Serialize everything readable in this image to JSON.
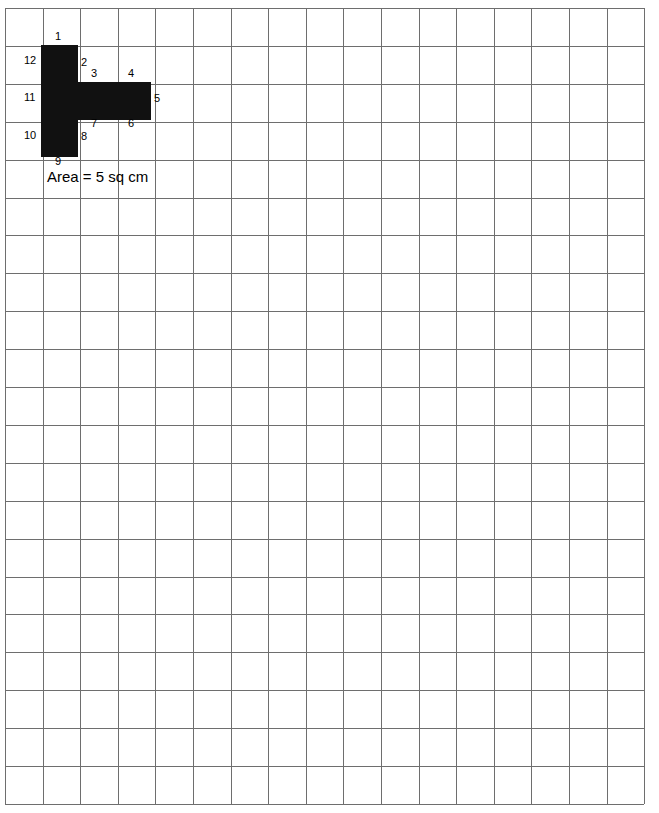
{
  "worksheet": {
    "caption": "Area = 5 sq cm",
    "grid": {
      "columns": 17,
      "rows": 21,
      "origin_x": 5,
      "origin_y": 8,
      "cell_width": 37.6,
      "cell_height": 37.9,
      "line_color": "#6e6e6e"
    },
    "shape": {
      "name": "t-pentomino",
      "fill_color": "#111111",
      "area_value": 5,
      "area_units": "sq cm",
      "cells": [
        {
          "col": 1,
          "row": 1
        },
        {
          "col": 1,
          "row": 2
        },
        {
          "col": 1,
          "row": 3
        },
        {
          "col": 2,
          "row": 2
        },
        {
          "col": 3,
          "row": 2
        }
      ],
      "rects": [
        {
          "x": 41,
          "y": 45,
          "width": 37,
          "height": 112
        },
        {
          "x": 78,
          "y": 82,
          "width": 73,
          "height": 38
        }
      ]
    },
    "vertex_labels": [
      {
        "text": "1",
        "x": 55,
        "y": 31
      },
      {
        "text": "2",
        "x": 81,
        "y": 57
      },
      {
        "text": "3",
        "x": 91,
        "y": 68
      },
      {
        "text": "4",
        "x": 128,
        "y": 68
      },
      {
        "text": "5",
        "x": 154,
        "y": 93
      },
      {
        "text": "6",
        "x": 128,
        "y": 118
      },
      {
        "text": "7",
        "x": 91,
        "y": 118
      },
      {
        "text": "8",
        "x": 81,
        "y": 131
      },
      {
        "text": "9",
        "x": 55,
        "y": 156
      }
    ],
    "row_labels": [
      {
        "text": "12",
        "x": 24,
        "y": 55
      },
      {
        "text": "11",
        "x": 24,
        "y": 92
      },
      {
        "text": "10",
        "x": 24,
        "y": 130
      }
    ]
  }
}
